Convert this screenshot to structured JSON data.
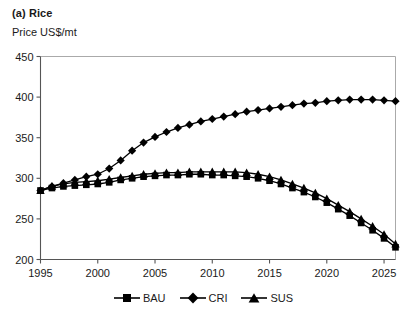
{
  "figure": {
    "title": "(a) Rice",
    "y_axis_label": "Price US$/mt"
  },
  "legend": {
    "position": "bottom-center",
    "items": [
      {
        "label": "BAU",
        "marker": "square-marker"
      },
      {
        "label": "CRI",
        "marker": "diamond-marker"
      },
      {
        "label": "SUS",
        "marker": "triangle-marker"
      }
    ]
  },
  "chart_data": {
    "type": "line",
    "title": "(a) Rice",
    "subtitle": "",
    "xlabel": "",
    "ylabel": "Price US$/mt",
    "xlim": [
      1995,
      2026
    ],
    "ylim": [
      200,
      450
    ],
    "yticks": [
      200,
      250,
      300,
      350,
      400,
      450
    ],
    "xticks": [
      1995,
      2000,
      2005,
      2010,
      2015,
      2020,
      2025
    ],
    "grid": false,
    "legend_position": "bottom-center",
    "x": [
      1995,
      1996,
      1997,
      1998,
      1999,
      2000,
      2001,
      2002,
      2003,
      2004,
      2005,
      2006,
      2007,
      2008,
      2009,
      2010,
      2011,
      2012,
      2013,
      2014,
      2015,
      2016,
      2017,
      2018,
      2019,
      2020,
      2021,
      2022,
      2023,
      2024,
      2025,
      2026
    ],
    "series": [
      {
        "name": "BAU",
        "marker": "square",
        "color": "#000000",
        "values": [
          285,
          288,
          290,
          291,
          292,
          293,
          295,
          298,
          300,
          302,
          303,
          304,
          304,
          305,
          305,
          304,
          304,
          303,
          302,
          300,
          297,
          293,
          288,
          283,
          277,
          270,
          262,
          254,
          245,
          236,
          226,
          215
        ]
      },
      {
        "name": "CRI",
        "marker": "diamond",
        "color": "#000000",
        "values": [
          285,
          290,
          294,
          298,
          302,
          305,
          312,
          322,
          334,
          344,
          351,
          357,
          362,
          366,
          370,
          373,
          376,
          379,
          382,
          384,
          386,
          388,
          390,
          392,
          393,
          395,
          396,
          397,
          397,
          397,
          396,
          395
        ]
      },
      {
        "name": "SUS",
        "marker": "triangle",
        "color": "#000000",
        "values": [
          285,
          290,
          293,
          295,
          296,
          297,
          299,
          301,
          303,
          305,
          306,
          307,
          307,
          308,
          308,
          308,
          308,
          308,
          307,
          305,
          302,
          298,
          293,
          288,
          282,
          275,
          267,
          259,
          250,
          241,
          231,
          219
        ]
      }
    ]
  }
}
